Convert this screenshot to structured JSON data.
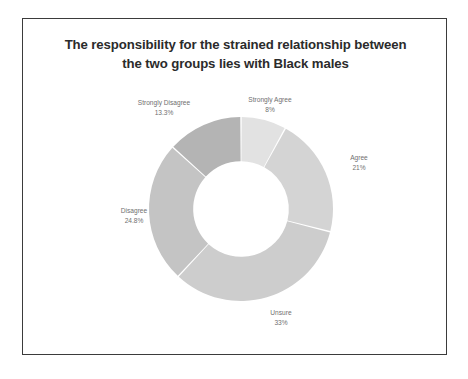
{
  "chart": {
    "title_line_1": "The responsibility for the strained relationship between",
    "title_line_2": "the two groups lies with Black males"
  },
  "labels": {
    "strongly_agree": {
      "name": "Strongly Agree",
      "pct": "8%"
    },
    "agree": {
      "name": "Agree",
      "pct": "21%"
    },
    "unsure": {
      "name": "Unsure",
      "pct": "33%"
    },
    "disagree": {
      "name": "Disagree",
      "pct": "24.8%"
    },
    "strongly_disagree": {
      "name": "Strongly Disagree",
      "pct": "13.3%"
    }
  },
  "chart_data": {
    "type": "pie",
    "variant": "donut",
    "title": "The responsibility for the strained relationship between the two groups lies with Black males",
    "categories": [
      "Strongly Agree",
      "Agree",
      "Unsure",
      "Disagree",
      "Strongly Disagree"
    ],
    "values": [
      8,
      21,
      33,
      24.8,
      13.3
    ],
    "value_labels": [
      "8%",
      "21%",
      "33%",
      "24.8%",
      "13.3%"
    ],
    "unit": "percent",
    "colors": [
      "#e2e2e2",
      "#d4d4d4",
      "#cdcdcd",
      "#c4c4c4",
      "#b4b4b4"
    ],
    "start_angle_deg": 0,
    "direction": "clockwise",
    "legend": "none",
    "labels_position": "outside",
    "grid": false,
    "inner_radius_ratio": 0.52
  }
}
